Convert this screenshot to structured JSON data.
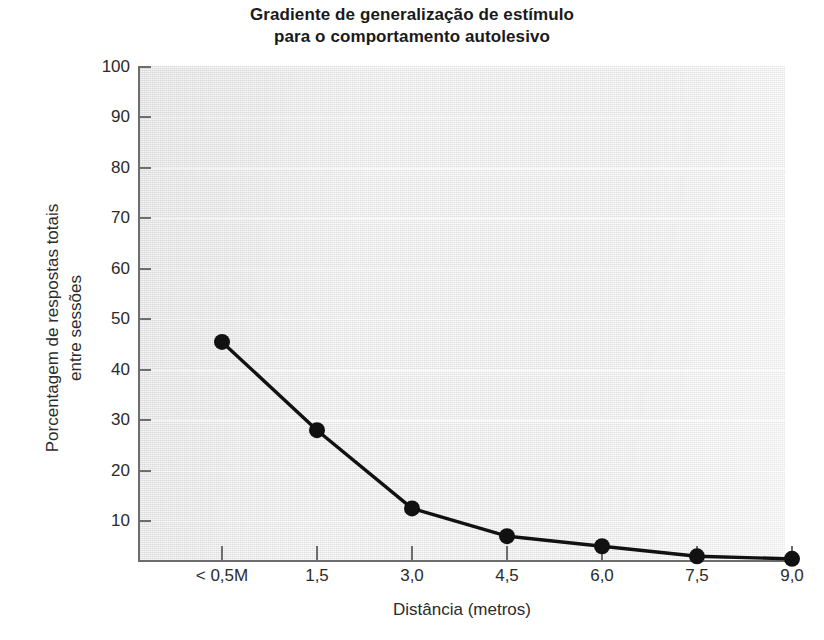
{
  "chart_data": {
    "type": "line",
    "title": "Gradiente de generalização de estímulo para o comportamento autolesivo",
    "title_line1": "Gradiente de generalização de estímulo",
    "title_line2": "para o comportamento autolesivo",
    "xlabel": "Distância (metros)",
    "ylabel": "Porcentagem de respostas totais entre sessões",
    "ylabel_line1": "Porcentagem de respostas totais",
    "ylabel_line2": "entre sessões",
    "categories": [
      "< 0,5M",
      "1,5",
      "3,0",
      "4,5",
      "6,0",
      "7,5",
      "9,0"
    ],
    "values": [
      45.5,
      28,
      12.5,
      7,
      5,
      3,
      2.5
    ],
    "ylim": [
      0,
      100
    ],
    "ytick_labels": [
      "10",
      "20",
      "30",
      "40",
      "50",
      "60",
      "70",
      "80",
      "90",
      "100"
    ],
    "ytick_values": [
      10,
      20,
      30,
      40,
      50,
      60,
      70,
      80,
      90,
      100
    ],
    "grid": false,
    "legend": "none",
    "series": [
      {
        "name": "Porcentagem de respostas totais entre sessões",
        "values": [
          45.5,
          28,
          12.5,
          7,
          5,
          3,
          2.5
        ],
        "marker": "filled-circle",
        "color": "#111111",
        "line_color": "#111111"
      }
    ],
    "colors": {
      "plot_background": "#ededed",
      "axis": "#6d6d6d",
      "text": "#2b2b2b",
      "title": "#1a1a1a",
      "series": "#111111"
    }
  }
}
